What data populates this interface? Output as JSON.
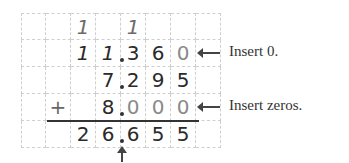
{
  "problem": {
    "description": "Adding decimals: 11.36 + 7.295 + 8 = 26.655",
    "rows": [
      {
        "role": "carries",
        "cells": [
          "",
          "",
          "1",
          "",
          "1",
          "",
          "",
          ""
        ]
      },
      {
        "role": "addend-1",
        "cells": [
          "",
          "",
          "1",
          "1",
          "3",
          "6",
          "0",
          ""
        ],
        "value": "11.360",
        "inserted_zero_cols": [
          6
        ]
      },
      {
        "role": "addend-2",
        "cells": [
          "",
          "",
          "",
          "7",
          "2",
          "9",
          "5",
          ""
        ],
        "value": "7.295"
      },
      {
        "role": "addend-3",
        "cells": [
          "+",
          "",
          "",
          "8",
          "0",
          "0",
          "0",
          ""
        ],
        "value": "8.000",
        "inserted_zero_cols": [
          4,
          5,
          6
        ]
      },
      {
        "role": "sum",
        "cells": [
          "",
          "",
          "2",
          "6",
          "6",
          "5",
          "5",
          ""
        ],
        "value": "26.655"
      }
    ],
    "decimal_point_column_boundary": 4
  },
  "annotations": {
    "insert_zero": "Insert 0.",
    "insert_zeros": "Insert zeros."
  },
  "colors": {
    "digit": "#2a2a2a",
    "inserted_digit": "#8a8a8a",
    "grid": "#cfcfcf",
    "rule": "#333333"
  }
}
